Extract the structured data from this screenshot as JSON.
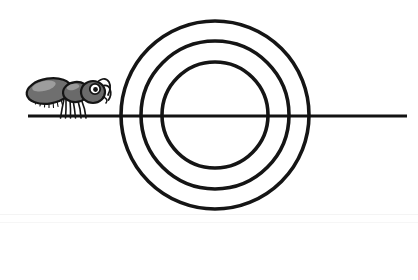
{
  "image": {
    "title": "Ant approaching concentric circles",
    "width": 418,
    "height": 280,
    "background_color": "#ffffff",
    "stroke_color": "#1a1a1a",
    "alt_text": "A cartoon ant walks rightward along a horizontal line toward three concentric circles centered on the line"
  },
  "scene": {
    "ground_line": {
      "label": "ground-line",
      "x_start": 28,
      "x_end": 407,
      "y": 116,
      "thickness": 3,
      "color": "#121212"
    },
    "target": {
      "label": "concentric-circles",
      "center_x": 215,
      "center_y": 115,
      "stroke_width": 3.6,
      "stroke_color": "#151515",
      "fill": "none",
      "rings": [
        {
          "name": "outer-circle",
          "radius": 94
        },
        {
          "name": "middle-circle",
          "radius": 74
        },
        {
          "name": "inner-circle",
          "radius": 53
        }
      ]
    },
    "ant": {
      "label": "ant-figure",
      "facing": "right",
      "bounds": {
        "x": 28,
        "y": 77,
        "width": 82,
        "height": 43
      },
      "body_color": "#6e6e6e",
      "body_highlight": "#9a9a9a",
      "outline_color": "#141414",
      "parts": [
        "abdomen",
        "thorax",
        "head",
        "eye",
        "antenna-upper",
        "antenna-lower",
        "legs",
        "abdomen-bristles"
      ]
    },
    "faint_bands": [
      {
        "name": "faint-band-upper",
        "y": 214
      },
      {
        "name": "faint-band-lower",
        "y": 222
      }
    ]
  }
}
